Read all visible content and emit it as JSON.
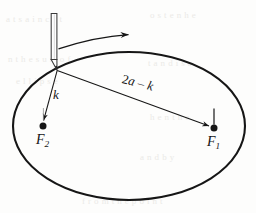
{
  "figure": {
    "name": "ellipse-string-construction",
    "background_color": "#fdfdfc",
    "ink_color": "#161616",
    "width": 256,
    "height": 213
  },
  "labels": {
    "k": "k",
    "segment_long_prefix": "2",
    "segment_long_a": "a",
    "segment_long_minus": " – ",
    "segment_long_k": "k",
    "focus_2_letter": "F",
    "focus_2_sub": "2",
    "focus_1_letter": "F",
    "focus_1_sub": "1"
  },
  "elements": {
    "ellipse_name": "ellipse-curve",
    "pencil_name": "pencil",
    "motion_arrow_name": "motion-arrow",
    "segment_k_name": "segment-k",
    "segment_long_name": "segment-2a-minus-k",
    "focus_1_dot_name": "focus-1-dot",
    "focus_2_dot_name": "focus-2-dot"
  },
  "geometry": {
    "ellipse": {
      "cx": 129,
      "cy": 126,
      "rx": 116,
      "ry": 74
    },
    "pencil_tip": {
      "x": 57,
      "y": 70
    },
    "focus_1": {
      "x": 214,
      "y": 128
    },
    "focus_2": {
      "x": 43,
      "y": 126
    }
  },
  "background_ghost_text": [
    {
      "text": "a  t   s  a     i   n    c  e   t",
      "x": 6,
      "y": 14
    },
    {
      "text": "o      s    t   e   n     h   e",
      "x": 150,
      "y": 10
    },
    {
      "text": "n  t   h  e   s  u  m    o  f",
      "x": 8,
      "y": 54
    },
    {
      "text": "t   a  n   d    i   s   a",
      "x": 148,
      "y": 58
    },
    {
      "text": "e   l  l   i   p  s   e",
      "x": 16,
      "y": 76
    },
    {
      "text": "h   e   n    t   h  e",
      "x": 150,
      "y": 112
    },
    {
      "text": "a   n   d       b   y",
      "x": 140,
      "y": 152
    },
    {
      "text": "f   r  o  m     t   h  e     p  o  i  n  t",
      "x": 82,
      "y": 196
    }
  ]
}
